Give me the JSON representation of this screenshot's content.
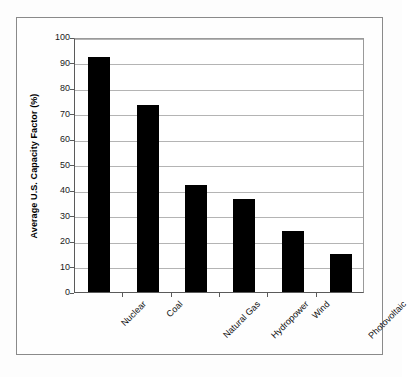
{
  "chart_data": {
    "type": "bar",
    "title": "",
    "subtitle": "",
    "xlabel": "",
    "ylabel": "Average U.S. Capacity Factor (%)",
    "categories": [
      "Nuclear",
      "Coal",
      "Natural Gas",
      "Hydropower",
      "Wind",
      "Photovoltaic"
    ],
    "values": [
      92,
      73.5,
      42,
      36.5,
      24,
      15
    ],
    "series": [
      {
        "name": "Average U.S. Capacity Factor",
        "values": [
          92,
          73.5,
          42,
          36.5,
          24,
          15
        ]
      }
    ],
    "ylim": [
      0,
      100
    ],
    "ytick_labels": [
      "0",
      "10",
      "20",
      "30",
      "40",
      "50",
      "60",
      "70",
      "80",
      "90",
      "100"
    ],
    "ytick_values": [
      0,
      10,
      20,
      30,
      40,
      50,
      60,
      70,
      80,
      90,
      100
    ],
    "grid": true,
    "grid_axis": "y",
    "legend": false,
    "legend_position": "none",
    "bar_color": "#000000",
    "plot_background": "#ffffff",
    "figure_background": "#fefefe",
    "gridline_color": "#b4b4b4",
    "axis_color": "#5a5a5a",
    "xtick_label_rotation": -45,
    "annotations": []
  }
}
